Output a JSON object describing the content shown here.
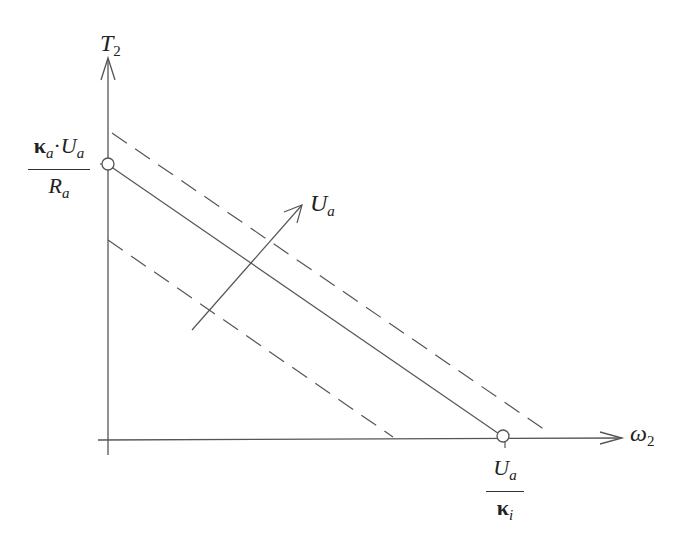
{
  "diagram": {
    "type": "line-characteristic",
    "y_axis": {
      "label_main": "T",
      "label_sub": "2"
    },
    "x_axis": {
      "label_main": "ω",
      "label_sub": "2"
    },
    "y_intercept_label": {
      "numerator_kappa": "κ",
      "numerator_kappa_sub": "a",
      "numerator_dot": "·",
      "numerator_U": "U",
      "numerator_U_sub": "a",
      "denominator": "R",
      "denominator_sub": "a"
    },
    "x_intercept_label": {
      "numerator": "U",
      "numerator_sub": "a",
      "denominator_kappa": "κ",
      "denominator_sub": "i"
    },
    "direction_arrow_label": {
      "main": "U",
      "sub": "a"
    },
    "lines": [
      {
        "name": "lower-dashed",
        "style": "dashed",
        "from": [
          108,
          240
        ],
        "to": [
          393,
          437
        ]
      },
      {
        "name": "nominal-solid",
        "style": "solid",
        "from": [
          108,
          165
        ],
        "to": [
          505,
          438
        ]
      },
      {
        "name": "upper-dashed",
        "style": "dashed",
        "from": [
          112,
          133
        ],
        "to": [
          548,
          432
        ]
      }
    ],
    "colors": {
      "line": "#555555",
      "text": "#222222",
      "background": "#ffffff"
    }
  }
}
